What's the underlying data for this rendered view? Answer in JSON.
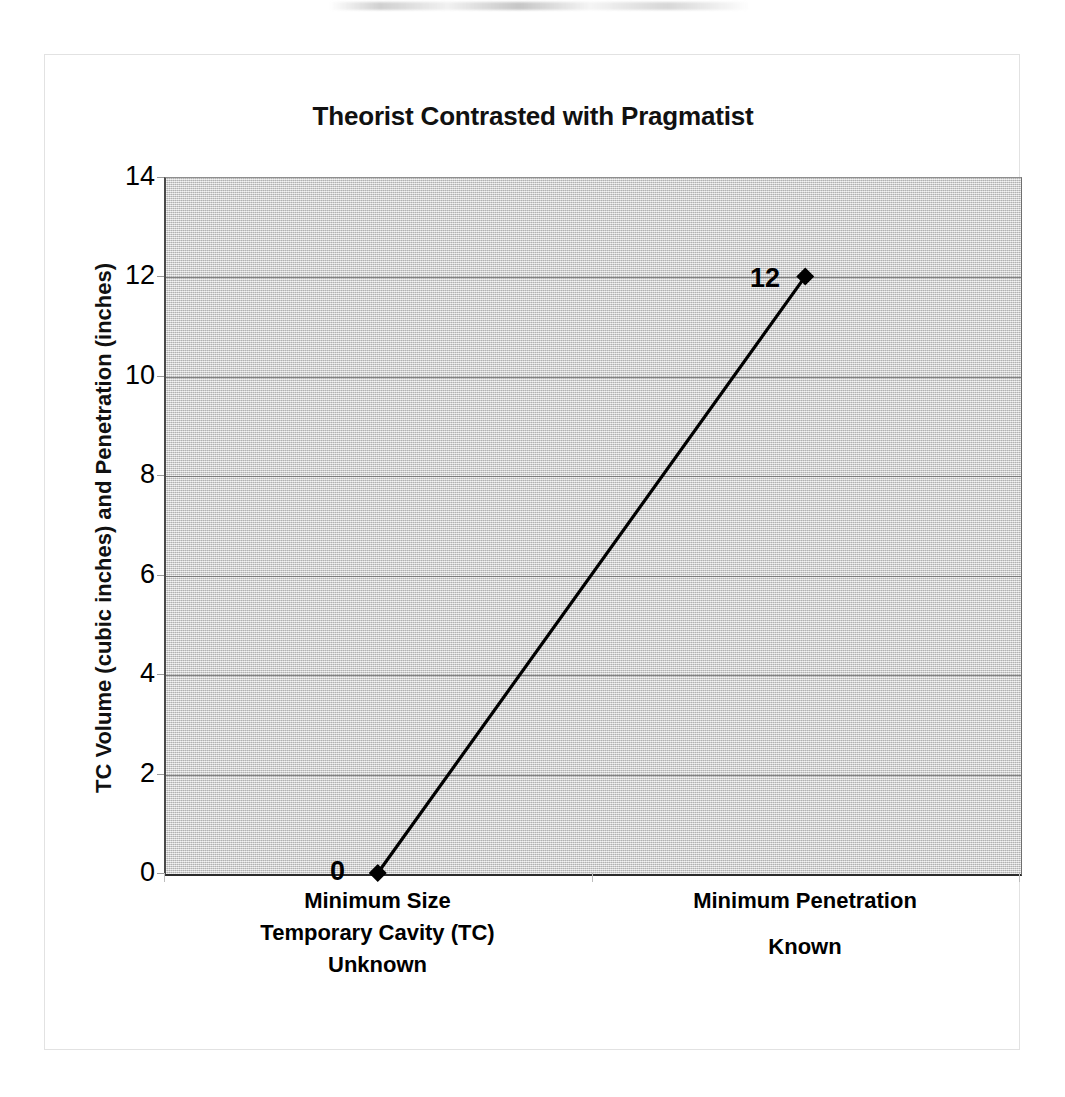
{
  "chart_data": {
    "type": "line",
    "title": "Theorist Contrasted with Pragmatist",
    "xlabel": "",
    "ylabel": "TC Volume (cubic inches) and Penetration (inches)",
    "categories": [
      "Minimum Size Temporary Cavity (TC) Unknown",
      "Minimum Penetration Known"
    ],
    "category_lines": [
      [
        "Minimum Size",
        "Temporary Cavity (TC)",
        "Unknown"
      ],
      [
        "Minimum Penetration",
        "Known"
      ]
    ],
    "values": [
      0,
      12
    ],
    "point_labels": [
      "0",
      "12"
    ],
    "ylim": [
      0,
      14
    ],
    "y_ticks": [
      "0",
      "2",
      "4",
      "6",
      "8",
      "10",
      "12",
      "14"
    ],
    "y_tick_values": [
      0,
      2,
      4,
      6,
      8,
      10,
      12,
      14
    ],
    "grid": "horizontal",
    "legend": "none",
    "marker": "diamond",
    "series_color": "#000000",
    "plot_background_color": "#c9c9c9",
    "gridline_color": "#6d6d6d",
    "axis_color": "#2b2b2b",
    "frame_color": "#e2e2e2",
    "text_color": "#000000"
  }
}
